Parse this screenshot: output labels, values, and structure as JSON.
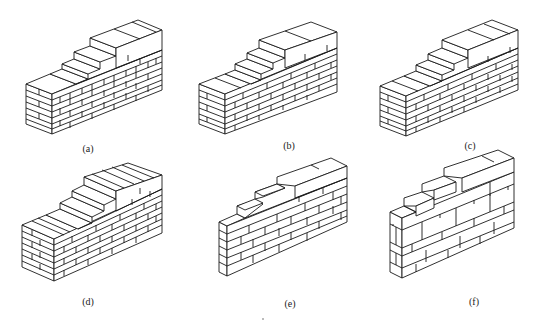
{
  "figures": [
    {
      "id": "a",
      "label": "(a)",
      "caption_x": 88,
      "caption_y": 143,
      "wall": {
        "x": 22,
        "y": 18,
        "front_w": 118,
        "rows": 7,
        "step_cols": 5,
        "bond": "bond-a"
      }
    },
    {
      "id": "b",
      "label": "(b)",
      "caption_x": 289,
      "caption_y": 140,
      "wall": {
        "x": 197,
        "y": 28,
        "front_w": 118,
        "rows": 7,
        "step_cols": 5,
        "bond": "bond-b"
      }
    },
    {
      "id": "c",
      "label": "(c)",
      "caption_x": 470,
      "caption_y": 140,
      "wall": {
        "x": 378,
        "y": 20,
        "front_w": 118,
        "rows": 7,
        "step_cols": 5,
        "bond": "bond-c"
      }
    },
    {
      "id": "d",
      "label": "(d)",
      "caption_x": 88,
      "caption_y": 296,
      "wall": {
        "x": 22,
        "y": 165,
        "front_w": 118,
        "rows": 7,
        "step_cols": 5,
        "bond": "bond-d"
      }
    },
    {
      "id": "e",
      "label": "(e)",
      "caption_x": 290,
      "caption_y": 298,
      "wall": {
        "x": 218,
        "y": 172,
        "front_w": 118,
        "rows": 6,
        "step_cols": 4,
        "bond": "bond-e"
      }
    },
    {
      "id": "f",
      "label": "(f)",
      "caption_x": 474,
      "caption_y": 296,
      "wall": {
        "x": 388,
        "y": 168,
        "front_w": 118,
        "rows": 5,
        "step_cols": 4,
        "bond": "bond-f"
      }
    }
  ]
}
